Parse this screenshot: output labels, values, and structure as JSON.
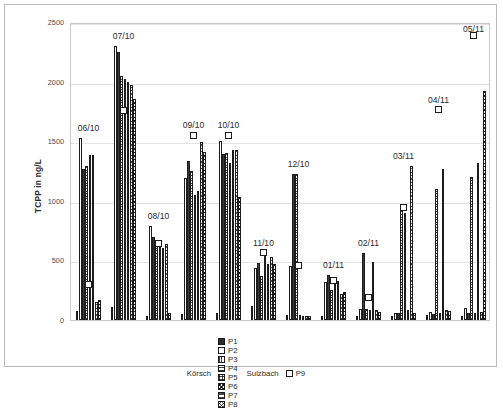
{
  "chart_data": {
    "type": "bar",
    "title": "",
    "xlabel": "",
    "ylabel": "TCPP in ng/L",
    "ylim": [
      0,
      2500
    ],
    "yticks": [
      0,
      500,
      1000,
      1500,
      2000,
      2500
    ],
    "grid": true,
    "legend_position": "bottom",
    "group_names": [
      "Körsch",
      "Sulzbach"
    ],
    "categories": [
      "06/10",
      "07/10",
      "08/10",
      "09/10",
      "10/10",
      "11/10",
      "12/10",
      "01/11",
      "02/11",
      "03/11",
      "04/11",
      "05/11"
    ],
    "series": [
      {
        "name": "P1",
        "values": [
          75,
          110,
          30,
          50,
          60,
          115,
          40,
          35,
          30,
          30,
          40,
          35
        ]
      },
      {
        "name": "P2",
        "values": [
          1530,
          2300,
          790,
          1190,
          1500,
          440,
          450,
          320,
          90,
          60,
          70,
          100
        ]
      },
      {
        "name": "P3",
        "values": [
          1270,
          2245,
          700,
          1330,
          1395,
          480,
          1225,
          380,
          560,
          60,
          50,
          55
        ]
      },
      {
        "name": "P4",
        "values": [
          1290,
          2050,
          620,
          1250,
          1400,
          370,
          1225,
          255,
          90,
          930,
          1100,
          1200
        ]
      },
      {
        "name": "P5",
        "values": [
          1385,
          2020,
          610,
          1050,
          1320,
          560,
          40,
          325,
          85,
          895,
          60,
          60
        ]
      },
      {
        "name": "P6",
        "values": [
          1385,
          2000,
          600,
          1085,
          1430,
          470,
          35,
          330,
          485,
          85,
          1270,
          1320
        ]
      },
      {
        "name": "P7",
        "values": [
          150,
          1970,
          640,
          1490,
          1425,
          530,
          35,
          215,
          80,
          1290,
          80,
          70
        ]
      },
      {
        "name": "P8",
        "values": [
          165,
          1850,
          60,
          1410,
          1030,
          470,
          35,
          235,
          65,
          60,
          75,
          1925
        ]
      },
      {
        "name": "P9",
        "values": [
          300,
          1760,
          645,
          1550,
          1550,
          565,
          460,
          330,
          185,
          945,
          1765,
          2385
        ]
      }
    ],
    "marker_series": "P9",
    "marker_style": "open-square"
  },
  "legend": {
    "group1_name": "Körsch",
    "group2_name": "Sulzbach",
    "items": [
      {
        "label": "P1",
        "swatch": "solid-black"
      },
      {
        "label": "P2",
        "swatch": "open-white"
      },
      {
        "label": "P3",
        "swatch": "vertical-hatch"
      },
      {
        "label": "P4",
        "swatch": "horizontal-hatch"
      },
      {
        "label": "P5",
        "swatch": "grid-hatch"
      },
      {
        "label": "P6",
        "swatch": "cross-hatch"
      },
      {
        "label": "P7",
        "swatch": "wide-horizontal-hatch"
      },
      {
        "label": "P8",
        "swatch": "diagonal-cross-hatch"
      }
    ],
    "marker_item": {
      "label": "P9",
      "swatch": "open-square-marker"
    }
  },
  "colors": {
    "bar_outline": "#1c1c1c",
    "grid": "#e2e2e2",
    "frame": "#b9b9b9",
    "text": "#2b2b2b"
  }
}
